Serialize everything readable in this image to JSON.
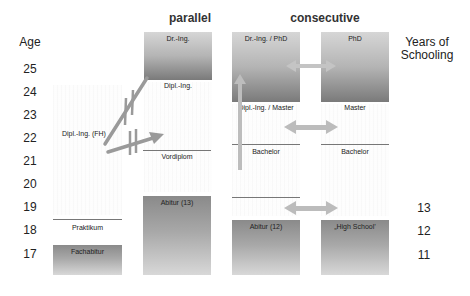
{
  "titles": {
    "parallel": "parallel",
    "consecutive": "consecutive"
  },
  "age_axis": {
    "header": "Age",
    "ticks": [
      "25",
      "24",
      "23",
      "22",
      "21",
      "20",
      "19",
      "18",
      "17"
    ]
  },
  "schooling_axis": {
    "header_line1": "Years of",
    "header_line2": "Schooling",
    "ticks": [
      "13",
      "12",
      "11"
    ]
  },
  "parallel": {
    "dr_ing": "Dr.-Ing.",
    "dipl_ing": "Dipl.-Ing.",
    "dipl_ing_fh": "Dipl.-Ing. (FH)",
    "vordiplom": "Vordiplom",
    "abitur13": "Abitur (13)",
    "praktikum": "Praktikum",
    "fachabitur": "Fachabitur"
  },
  "consecutive": {
    "col1": {
      "top": "Dr.-Ing. / PhD",
      "master": "Dipl.-Ing. / Master",
      "bachelor": "Bachelor",
      "school": "Abitur (12)"
    },
    "col2": {
      "top": "PhD",
      "master": "Master",
      "bachelor": "Bachelor",
      "school": "„High School’"
    }
  },
  "colors": {
    "arrow": "#a0a0a0",
    "arrow_light": "#c8c8c8",
    "box_dark": "#7a7a7a",
    "box_light": "#d8d8d8"
  }
}
